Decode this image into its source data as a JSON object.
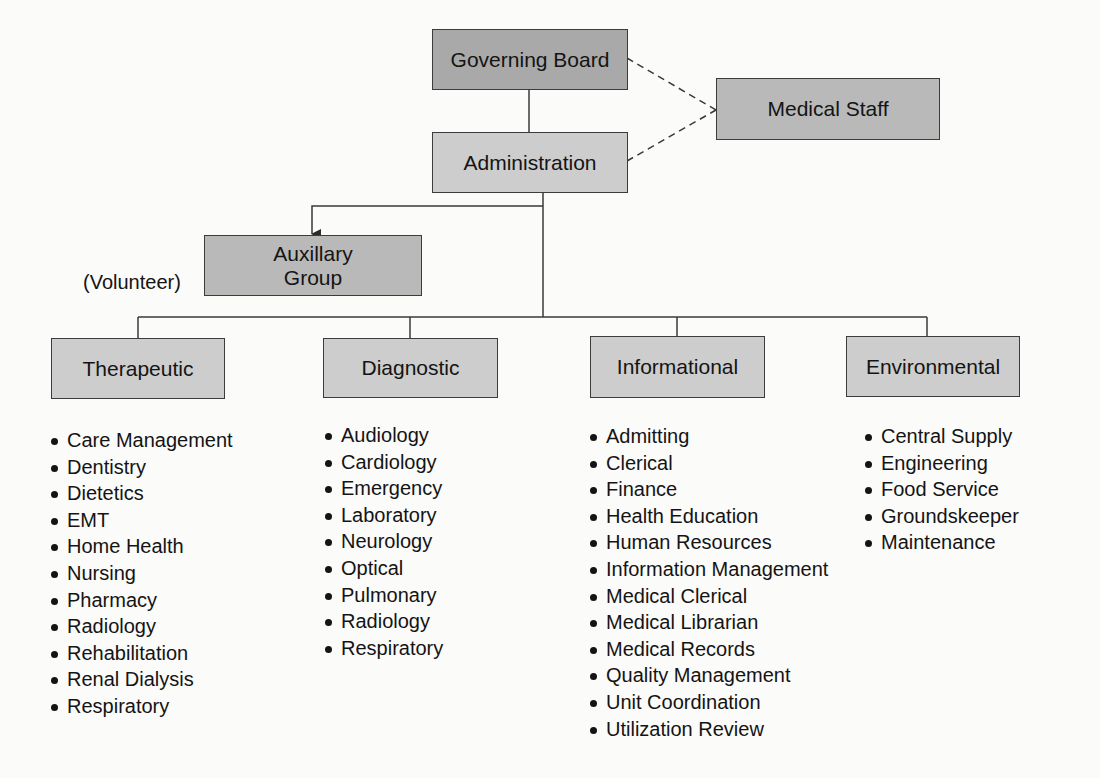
{
  "org_chart": {
    "governing_board": "Governing Board",
    "medical_staff": "Medical Staff",
    "administration": "Administration",
    "auxillary_group": "Auxillary\nGroup",
    "auxillary_line1": "Auxillary",
    "auxillary_line2": "Group",
    "volunteer_note": "(Volunteer)",
    "departments": [
      {
        "name": "Therapeutic",
        "services": [
          "Care Management",
          "Dentistry",
          "Dietetics",
          "EMT",
          "Home Health",
          "Nursing",
          "Pharmacy",
          "Radiology",
          "Rehabilitation",
          "Renal Dialysis",
          "Respiratory"
        ]
      },
      {
        "name": "Diagnostic",
        "services": [
          "Audiology",
          "Cardiology",
          "Emergency",
          "Laboratory",
          "Neurology",
          "Optical",
          "Pulmonary",
          "Radiology",
          "Respiratory"
        ]
      },
      {
        "name": "Informational",
        "services": [
          "Admitting",
          "Clerical",
          "Finance",
          "Health Education",
          "Human Resources",
          "Information Management",
          "Medical Clerical",
          "Medical Librarian",
          "Medical Records",
          "Quality Management",
          "Unit Coordination",
          "Utilization Review"
        ]
      },
      {
        "name": "Environmental",
        "services": [
          "Central Supply",
          "Engineering",
          "Food Service",
          "Groundskeeper",
          "Maintenance"
        ]
      }
    ]
  }
}
